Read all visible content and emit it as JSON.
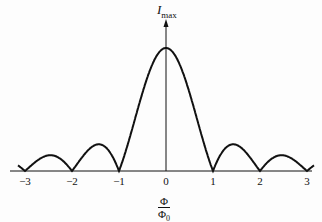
{
  "chart_data": {
    "type": "line",
    "title": "",
    "xlabel": "Φ/Φ0",
    "ylabel": "I_max",
    "x_ticks": [
      "-3",
      "-2",
      "-1",
      "0",
      "1",
      "2",
      "3"
    ],
    "xlim": [
      -3.2,
      3.2
    ],
    "grid": false,
    "legend": null,
    "x": [
      -3,
      -2.5,
      -2,
      -1.5,
      -1,
      -0.5,
      0,
      0.5,
      1,
      1.5,
      2,
      2.5,
      3
    ],
    "values": [
      0,
      0.13,
      0,
      0.21,
      0,
      0.64,
      1.0,
      0.64,
      0,
      0.21,
      0,
      0.13,
      0
    ]
  },
  "labels": {
    "y_axis_main": "I",
    "y_axis_sub": "max",
    "x_num": "Φ",
    "x_den_main": "Φ",
    "x_den_sub": "0",
    "ticks": [
      "−3",
      "−2",
      "−1",
      "0",
      "1",
      "2",
      "3"
    ]
  }
}
